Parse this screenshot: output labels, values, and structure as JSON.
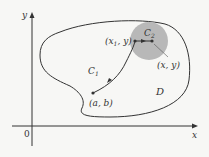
{
  "diagram": {
    "axes": {
      "x_label": "x",
      "y_label": "y",
      "origin_label": "0"
    },
    "region": {
      "label": "D"
    },
    "curves": {
      "c1": {
        "label": "C",
        "subscript": "1"
      },
      "c2": {
        "label": "C",
        "subscript": "2"
      }
    },
    "points": {
      "start": {
        "label": "(a, b)"
      },
      "x1y": {
        "label_open": "(x",
        "label_sub": "1",
        "label_close": ", y)"
      },
      "xy": {
        "label": "(x, y)"
      }
    },
    "colors": {
      "background": "#f7f7f5",
      "stroke": "#333333",
      "disk_fill": "#b8b8b8"
    }
  }
}
